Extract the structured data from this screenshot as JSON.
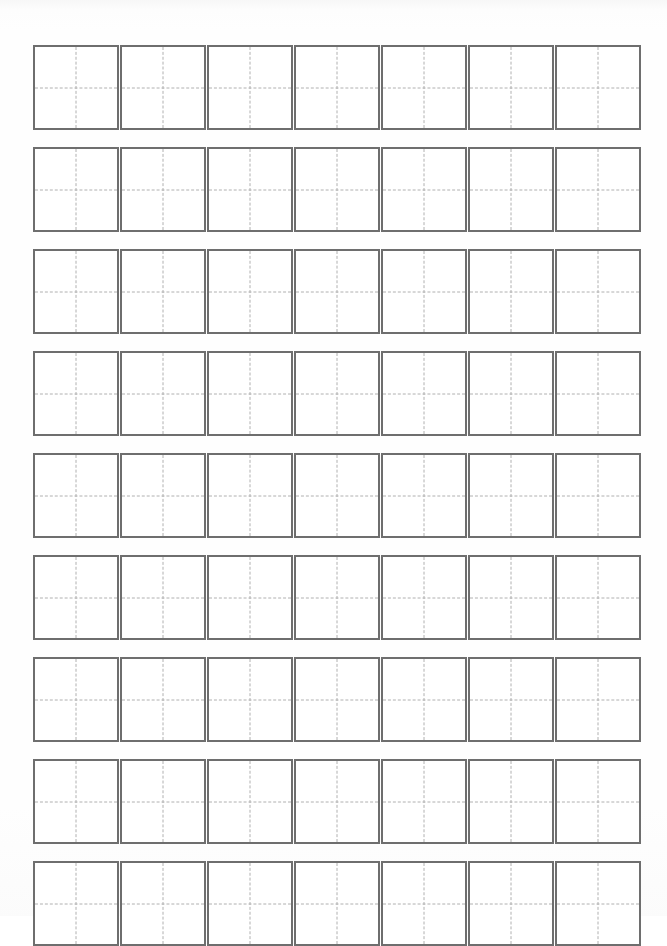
{
  "document": {
    "kind": "character-practice-worksheet",
    "title": "Chinese Character Practice Grid",
    "grid_style": "tianzige",
    "page_background": "#fefefe",
    "cell_border_color": "#6e6e6e",
    "cell_fill_color": "#ffffff",
    "guide_line_color": "#b0b0b0",
    "guide_line_style": "dashed"
  },
  "grid": {
    "columns": 7,
    "rows": 9,
    "total_cells": 63,
    "cell_width_px": 86,
    "cell_height_px": 85,
    "column_gap_px": 1,
    "row_gap_px": 17,
    "origin_x_px": 33,
    "origin_y_px": 45,
    "border_width_px": 2.5,
    "guides": [
      "vertical-center",
      "horizontal-center"
    ]
  },
  "cells": [
    {
      "row": 1,
      "column": 1,
      "content": ""
    },
    {
      "row": 1,
      "column": 2,
      "content": ""
    },
    {
      "row": 1,
      "column": 3,
      "content": ""
    },
    {
      "row": 1,
      "column": 4,
      "content": ""
    },
    {
      "row": 1,
      "column": 5,
      "content": ""
    },
    {
      "row": 1,
      "column": 6,
      "content": ""
    },
    {
      "row": 1,
      "column": 7,
      "content": ""
    },
    {
      "row": 2,
      "column": 1,
      "content": ""
    },
    {
      "row": 2,
      "column": 2,
      "content": ""
    },
    {
      "row": 2,
      "column": 3,
      "content": ""
    },
    {
      "row": 2,
      "column": 4,
      "content": ""
    },
    {
      "row": 2,
      "column": 5,
      "content": ""
    },
    {
      "row": 2,
      "column": 6,
      "content": ""
    },
    {
      "row": 2,
      "column": 7,
      "content": ""
    },
    {
      "row": 3,
      "column": 1,
      "content": ""
    },
    {
      "row": 3,
      "column": 2,
      "content": ""
    },
    {
      "row": 3,
      "column": 3,
      "content": ""
    },
    {
      "row": 3,
      "column": 4,
      "content": ""
    },
    {
      "row": 3,
      "column": 5,
      "content": ""
    },
    {
      "row": 3,
      "column": 6,
      "content": ""
    },
    {
      "row": 3,
      "column": 7,
      "content": ""
    },
    {
      "row": 4,
      "column": 1,
      "content": ""
    },
    {
      "row": 4,
      "column": 2,
      "content": ""
    },
    {
      "row": 4,
      "column": 3,
      "content": ""
    },
    {
      "row": 4,
      "column": 4,
      "content": ""
    },
    {
      "row": 4,
      "column": 5,
      "content": ""
    },
    {
      "row": 4,
      "column": 6,
      "content": ""
    },
    {
      "row": 4,
      "column": 7,
      "content": ""
    },
    {
      "row": 5,
      "column": 1,
      "content": ""
    },
    {
      "row": 5,
      "column": 2,
      "content": ""
    },
    {
      "row": 5,
      "column": 3,
      "content": ""
    },
    {
      "row": 5,
      "column": 4,
      "content": ""
    },
    {
      "row": 5,
      "column": 5,
      "content": ""
    },
    {
      "row": 5,
      "column": 6,
      "content": ""
    },
    {
      "row": 5,
      "column": 7,
      "content": ""
    },
    {
      "row": 6,
      "column": 1,
      "content": ""
    },
    {
      "row": 6,
      "column": 2,
      "content": ""
    },
    {
      "row": 6,
      "column": 3,
      "content": ""
    },
    {
      "row": 6,
      "column": 4,
      "content": ""
    },
    {
      "row": 6,
      "column": 5,
      "content": ""
    },
    {
      "row": 6,
      "column": 6,
      "content": ""
    },
    {
      "row": 6,
      "column": 7,
      "content": ""
    },
    {
      "row": 7,
      "column": 1,
      "content": ""
    },
    {
      "row": 7,
      "column": 2,
      "content": ""
    },
    {
      "row": 7,
      "column": 3,
      "content": ""
    },
    {
      "row": 7,
      "column": 4,
      "content": ""
    },
    {
      "row": 7,
      "column": 5,
      "content": ""
    },
    {
      "row": 7,
      "column": 6,
      "content": ""
    },
    {
      "row": 7,
      "column": 7,
      "content": ""
    },
    {
      "row": 8,
      "column": 1,
      "content": ""
    },
    {
      "row": 8,
      "column": 2,
      "content": ""
    },
    {
      "row": 8,
      "column": 3,
      "content": ""
    },
    {
      "row": 8,
      "column": 4,
      "content": ""
    },
    {
      "row": 8,
      "column": 5,
      "content": ""
    },
    {
      "row": 8,
      "column": 6,
      "content": ""
    },
    {
      "row": 8,
      "column": 7,
      "content": ""
    },
    {
      "row": 9,
      "column": 1,
      "content": ""
    },
    {
      "row": 9,
      "column": 2,
      "content": ""
    },
    {
      "row": 9,
      "column": 3,
      "content": ""
    },
    {
      "row": 9,
      "column": 4,
      "content": ""
    },
    {
      "row": 9,
      "column": 5,
      "content": ""
    },
    {
      "row": 9,
      "column": 6,
      "content": ""
    },
    {
      "row": 9,
      "column": 7,
      "content": ""
    }
  ]
}
